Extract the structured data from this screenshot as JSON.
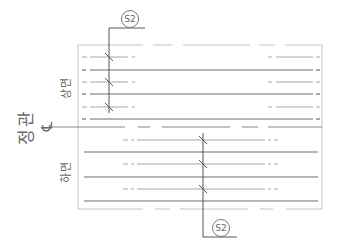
{
  "diagram": {
    "type": "rebar-section-plan",
    "labels": {
      "main": "정관",
      "upper_surface": "상면",
      "lower_surface": "하면",
      "centerline_symbol": "℄"
    },
    "section_tags": {
      "top": "S2",
      "bottom": "S2"
    },
    "colors": {
      "frame": "#bdbdbd",
      "solid_bar": "#6f6f6f",
      "dashed_bar": "#9e9e9e",
      "section_line": "#555555",
      "text": "#666666"
    },
    "upper_zone": {
      "dashed_bars_y": [
        57,
        82,
        107
      ],
      "solid_bars_y": [
        70,
        94,
        119
      ]
    },
    "lower_zone": {
      "dashed_bars_y": [
        140,
        164,
        189
      ],
      "solid_bars_y": [
        152,
        177,
        201
      ]
    }
  }
}
